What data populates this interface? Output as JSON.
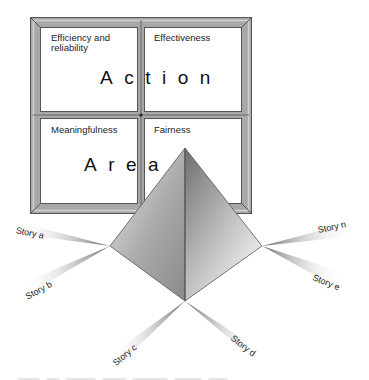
{
  "figure": {
    "window_quadrants": [
      {
        "id": "top-left",
        "label": "Efficiency and reliability",
        "label_lines": [
          "Efficiency and",
          "reliability"
        ]
      },
      {
        "id": "top-right",
        "label": "Effectiveness"
      },
      {
        "id": "bottom-left",
        "label": "Meaningfulness"
      },
      {
        "id": "bottom-right",
        "label": "Fairness"
      }
    ],
    "row_titles": {
      "top": "Action",
      "bottom": "Area"
    },
    "stories": [
      {
        "id": "a",
        "label": "Story a"
      },
      {
        "id": "b",
        "label": "Story b"
      },
      {
        "id": "c",
        "label": "Story c"
      },
      {
        "id": "d",
        "label": "Story d"
      },
      {
        "id": "e",
        "label": "Story e"
      },
      {
        "id": "n",
        "label": "Story n"
      }
    ],
    "central_shape": "pyramid",
    "colors": {
      "frame_outer": "#8c8c8c",
      "frame_inner": "#bdbdbd",
      "frame_line": "#5a5a5a",
      "pyramid_light": "#f2f2f2",
      "pyramid_dark": "#7a7a7a",
      "wedge_dark": "#777777"
    }
  }
}
